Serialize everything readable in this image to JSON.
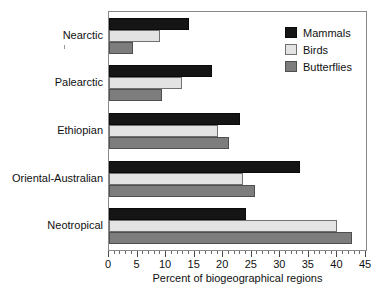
{
  "chart_data": {
    "type": "bar",
    "orientation": "horizontal",
    "title": "",
    "xlabel": "Percent of biogeographical regions",
    "ylabel": "",
    "xlim": [
      0,
      45
    ],
    "xticks": [
      0,
      5,
      10,
      15,
      20,
      25,
      30,
      35,
      40,
      45
    ],
    "xtick_labels": [
      "0",
      "5",
      "10",
      "15",
      "20",
      "25",
      "30",
      "35",
      "40",
      "45"
    ],
    "minor_tick_interval": 1,
    "grid": false,
    "legend_position": "top-right",
    "categories": [
      "Nearctic",
      "Palearctic",
      "Ethiopian",
      "Oriental-Australian",
      "Neotropical"
    ],
    "series": [
      {
        "name": "Mammals",
        "color": "#151515",
        "values": [
          14.0,
          18.0,
          23.0,
          33.5,
          24.0
        ]
      },
      {
        "name": "Birds",
        "color": "#e3e3e3",
        "values": [
          9.0,
          12.8,
          19.0,
          23.5,
          40.0
        ]
      },
      {
        "name": "Butterflies",
        "color": "#7d7d7d",
        "values": [
          4.2,
          9.3,
          21.0,
          25.5,
          42.5
        ]
      }
    ]
  },
  "legend": {
    "items": [
      {
        "label": "Mammals",
        "swatch": "mammals"
      },
      {
        "label": "Birds",
        "swatch": "birds"
      },
      {
        "label": "Butterflies",
        "swatch": "butterflies"
      }
    ]
  },
  "axis": {
    "x_label": "Percent of biogeographical regions"
  }
}
